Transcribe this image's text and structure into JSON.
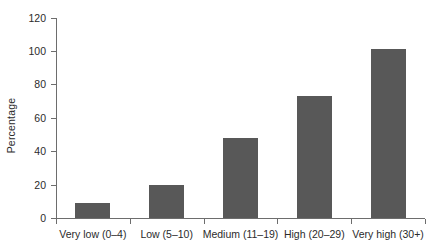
{
  "chart_data": {
    "type": "bar",
    "title": "",
    "xlabel": "",
    "ylabel": "Percentage",
    "categories": [
      "Very low (0–4)",
      "Low (5–10)",
      "Medium (11–19)",
      "High (20–29)",
      "Very high (30+)"
    ],
    "values": [
      9,
      20,
      48,
      73,
      101
    ],
    "ylim": [
      0,
      120
    ],
    "yticks": [
      0,
      20,
      40,
      60,
      80,
      100,
      120
    ],
    "ytick_labels": [
      "0",
      "20",
      "40",
      "60",
      "80",
      "100",
      "120"
    ],
    "grid": false,
    "legend": false,
    "legend_position": "none",
    "bar_color": "#585858",
    "axis_color": "#6d6d6d",
    "text_color": "#2b2b2b",
    "background_color": "#ffffff"
  }
}
